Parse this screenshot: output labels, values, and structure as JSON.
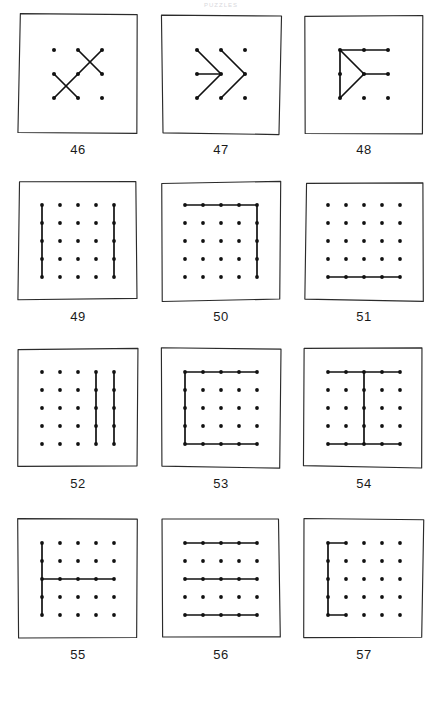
{
  "header": {
    "text": "PUZZLES"
  },
  "plate": {
    "grid_columns": 3,
    "grid_rows": 4,
    "ink_color": "#111111",
    "frame_color": "#2b2b2b",
    "paper_color": "#ffffff"
  },
  "figures": [
    {
      "caption": "46",
      "grid": 3,
      "description": "two crossing X shapes on a 3x3 dot lattice",
      "dots": [
        [
          1,
          1
        ],
        [
          2,
          1
        ],
        [
          3,
          1
        ],
        [
          1,
          2
        ],
        [
          2,
          2
        ],
        [
          3,
          2
        ],
        [
          1,
          3
        ],
        [
          2,
          3
        ],
        [
          3,
          3
        ]
      ],
      "lines": [
        {
          "from": [
            2,
            1
          ],
          "to": [
            3,
            2
          ]
        },
        {
          "from": [
            3,
            1
          ],
          "to": [
            2,
            2
          ]
        },
        {
          "from": [
            2,
            2
          ],
          "to": [
            1,
            3
          ]
        },
        {
          "from": [
            1,
            2
          ],
          "to": [
            2,
            3
          ]
        }
      ]
    },
    {
      "caption": "47",
      "grid": 3,
      "description": "two chevrons pointing right with a horizontal stem",
      "dots": [
        [
          1,
          1
        ],
        [
          2,
          1
        ],
        [
          3,
          1
        ],
        [
          1,
          2
        ],
        [
          2,
          2
        ],
        [
          3,
          2
        ],
        [
          1,
          3
        ],
        [
          2,
          3
        ],
        [
          3,
          3
        ]
      ],
      "lines": [
        {
          "from": [
            1,
            1
          ],
          "to": [
            2,
            2
          ]
        },
        {
          "from": [
            2,
            2
          ],
          "to": [
            1,
            3
          ]
        },
        {
          "from": [
            2,
            1
          ],
          "to": [
            3,
            2
          ]
        },
        {
          "from": [
            3,
            2
          ],
          "to": [
            2,
            3
          ]
        },
        {
          "from": [
            1,
            2
          ],
          "to": [
            2,
            2
          ]
        }
      ]
    },
    {
      "caption": "48",
      "grid": 3,
      "description": "right pointing triangle with top bar and middle bar",
      "dots": [
        [
          1,
          1
        ],
        [
          2,
          1
        ],
        [
          3,
          1
        ],
        [
          1,
          2
        ],
        [
          2,
          2
        ],
        [
          3,
          2
        ],
        [
          1,
          3
        ],
        [
          2,
          3
        ],
        [
          3,
          3
        ]
      ],
      "lines": [
        {
          "from": [
            1,
            1
          ],
          "to": [
            3,
            1
          ]
        },
        {
          "from": [
            1,
            1
          ],
          "to": [
            2,
            2
          ]
        },
        {
          "from": [
            2,
            2
          ],
          "to": [
            1,
            3
          ]
        },
        {
          "from": [
            1,
            1
          ],
          "to": [
            1,
            3
          ]
        },
        {
          "from": [
            2,
            2
          ],
          "to": [
            3,
            2
          ]
        }
      ]
    },
    {
      "caption": "49",
      "grid": 5,
      "description": "vertical lines down the first and fifth columns",
      "dots": null,
      "lines": [
        {
          "from": [
            1,
            1
          ],
          "to": [
            1,
            5
          ]
        },
        {
          "from": [
            5,
            1
          ],
          "to": [
            5,
            5
          ]
        }
      ]
    },
    {
      "caption": "50",
      "grid": 5,
      "description": "top row bar joined to right column bar",
      "dots": null,
      "lines": [
        {
          "from": [
            1,
            1
          ],
          "to": [
            5,
            1
          ]
        },
        {
          "from": [
            5,
            1
          ],
          "to": [
            5,
            5
          ]
        }
      ]
    },
    {
      "caption": "51",
      "grid": 5,
      "description": "single horizontal bar along the bottom row",
      "dots": null,
      "lines": [
        {
          "from": [
            1,
            5
          ],
          "to": [
            5,
            5
          ]
        }
      ]
    },
    {
      "caption": "52",
      "grid": 5,
      "description": "vertical lines down the fourth and fifth columns",
      "dots": null,
      "lines": [
        {
          "from": [
            4,
            1
          ],
          "to": [
            4,
            5
          ]
        },
        {
          "from": [
            5,
            1
          ],
          "to": [
            5,
            5
          ]
        }
      ]
    },
    {
      "caption": "53",
      "grid": 5,
      "description": "bracket shape: top row, left column and bottom row",
      "dots": null,
      "lines": [
        {
          "from": [
            1,
            1
          ],
          "to": [
            5,
            1
          ]
        },
        {
          "from": [
            1,
            1
          ],
          "to": [
            1,
            5
          ]
        },
        {
          "from": [
            1,
            5
          ],
          "to": [
            5,
            5
          ]
        }
      ]
    },
    {
      "caption": "54",
      "grid": 5,
      "description": "capital I: top row, bottom row and centre column",
      "dots": null,
      "lines": [
        {
          "from": [
            1,
            1
          ],
          "to": [
            5,
            1
          ]
        },
        {
          "from": [
            1,
            5
          ],
          "to": [
            5,
            5
          ]
        },
        {
          "from": [
            3,
            1
          ],
          "to": [
            3,
            5
          ]
        }
      ]
    },
    {
      "caption": "55",
      "grid": 5,
      "description": "left column vertical crossed by the middle row horizontal",
      "dots": null,
      "lines": [
        {
          "from": [
            1,
            1
          ],
          "to": [
            1,
            5
          ]
        },
        {
          "from": [
            1,
            3
          ],
          "to": [
            5,
            3
          ]
        }
      ]
    },
    {
      "caption": "56",
      "grid": 5,
      "description": "horizontal bars on rows one, three and five",
      "dots": null,
      "lines": [
        {
          "from": [
            1,
            1
          ],
          "to": [
            5,
            1
          ]
        },
        {
          "from": [
            1,
            3
          ],
          "to": [
            5,
            3
          ]
        },
        {
          "from": [
            1,
            5
          ],
          "to": [
            5,
            5
          ]
        }
      ]
    },
    {
      "caption": "57",
      "grid": 5,
      "description": "letter C made from the left column with short top and bottom arms",
      "dots": null,
      "lines": [
        {
          "from": [
            1,
            1
          ],
          "to": [
            2,
            1
          ]
        },
        {
          "from": [
            1,
            1
          ],
          "to": [
            1,
            5
          ]
        },
        {
          "from": [
            1,
            5
          ],
          "to": [
            2,
            5
          ]
        }
      ]
    }
  ]
}
